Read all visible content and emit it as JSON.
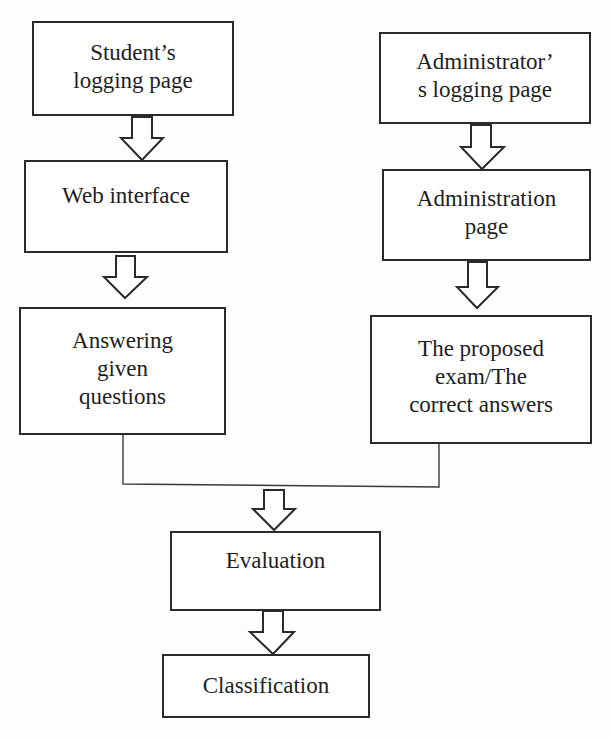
{
  "diagram": {
    "type": "flowchart",
    "nodes": [
      {
        "id": "student_login",
        "label": "Student’s\nlogging page"
      },
      {
        "id": "web_interface",
        "label": "Web interface"
      },
      {
        "id": "answering",
        "label": "Answering\ngiven\nquestions"
      },
      {
        "id": "admin_login",
        "label": "Administrator’\ns logging page"
      },
      {
        "id": "admin_page",
        "label": "Administration\npage"
      },
      {
        "id": "proposed_exam",
        "label": "The proposed\nexam/The\ncorrect answers"
      },
      {
        "id": "evaluation",
        "label": "Evaluation"
      },
      {
        "id": "classification",
        "label": "Classification"
      }
    ],
    "edges": [
      {
        "from": "student_login",
        "to": "web_interface",
        "style": "block-arrow"
      },
      {
        "from": "web_interface",
        "to": "answering",
        "style": "block-arrow"
      },
      {
        "from": "admin_login",
        "to": "admin_page",
        "style": "block-arrow"
      },
      {
        "from": "admin_page",
        "to": "proposed_exam",
        "style": "block-arrow"
      },
      {
        "from": "answering",
        "to": "evaluation",
        "style": "merge-line + block-arrow"
      },
      {
        "from": "proposed_exam",
        "to": "evaluation",
        "style": "merge-line + block-arrow"
      },
      {
        "from": "evaluation",
        "to": "classification",
        "style": "block-arrow"
      }
    ],
    "colors": {
      "line": "#2a2a2a",
      "background": "#fdfdfc",
      "box_fill": "#ffffff",
      "text": "#1e1e1e"
    }
  }
}
